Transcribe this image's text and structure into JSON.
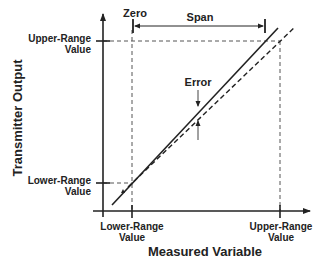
{
  "diagram": {
    "y_axis_label": "Transmitter Output",
    "x_axis_label": "Measured Variable",
    "y_ticks": [
      {
        "line1": "Upper-Range",
        "line2": "Value"
      },
      {
        "line1": "Lower-Range",
        "line2": "Value"
      }
    ],
    "x_ticks": [
      {
        "line1": "Lower-Range",
        "line2": "Value"
      },
      {
        "line1": "Upper-Range",
        "line2": "Value"
      }
    ],
    "annotations": {
      "zero": "Zero",
      "span": "Span",
      "error": "Error"
    },
    "series": [
      {
        "name": "actual-response",
        "style": "solid"
      },
      {
        "name": "ideal-response",
        "style": "dashed"
      }
    ],
    "colors": {
      "line": "#222222",
      "guide": "#555555"
    }
  }
}
